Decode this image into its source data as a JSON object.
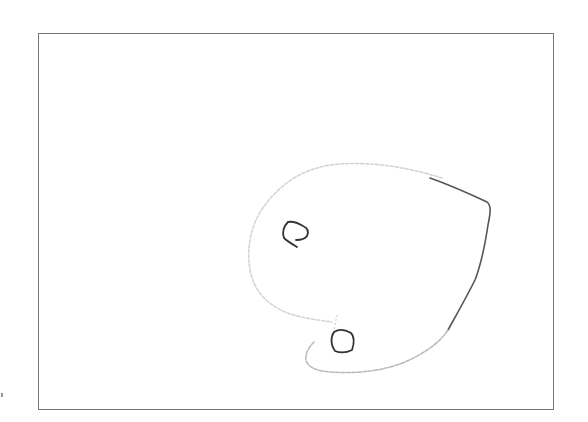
{
  "drawing": {
    "description": "Hand-drawn sketch of a rounded, leaf/droplet-shaped outline containing two small closed loops, inside a rectangular frame",
    "frame": {
      "x": 38,
      "y": 33,
      "width": 516,
      "height": 377,
      "stroke": "#777777"
    },
    "shapes": [
      {
        "name": "outer-outline",
        "stroke_light": "#cfcfcf",
        "stroke_dark": "#555555"
      },
      {
        "name": "upper-loop",
        "stroke": "#333333"
      },
      {
        "name": "lower-loop",
        "stroke": "#333333"
      }
    ],
    "background": "#ffffff"
  }
}
